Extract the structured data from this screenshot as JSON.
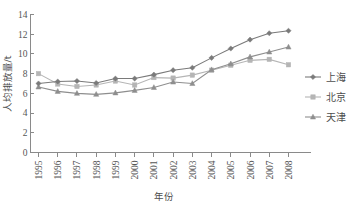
{
  "chart_data": {
    "type": "line",
    "title": "",
    "xlabel": "年份",
    "ylabel": "人均排放量/t",
    "x": [
      "1995",
      "1996",
      "1997",
      "1998",
      "1999",
      "2000",
      "2001",
      "2002",
      "2003",
      "2004",
      "2005",
      "2006",
      "2007",
      "2008"
    ],
    "categories": [
      "1995",
      "1996",
      "1997",
      "1998",
      "1999",
      "2000",
      "2001",
      "2002",
      "2003",
      "2004",
      "2005",
      "2006",
      "2007",
      "2008"
    ],
    "xlim": [
      1995,
      2008
    ],
    "ylim": [
      0,
      14
    ],
    "yticks": [
      0,
      2,
      4,
      6,
      8,
      10,
      12,
      14
    ],
    "ytick_labels": [
      "0",
      "2",
      "4",
      "6",
      "8",
      "10",
      "12",
      "14"
    ],
    "grid": false,
    "legend_position": "right",
    "series": [
      {
        "name": "上海",
        "marker": "diamond",
        "color": "#7a7a7a",
        "values": [
          7.0,
          7.2,
          7.25,
          7.05,
          7.5,
          7.5,
          7.9,
          8.35,
          8.6,
          9.6,
          10.55,
          11.45,
          12.1,
          12.35
        ]
      },
      {
        "name": "北京",
        "marker": "square",
        "color": "#b5b5b5",
        "values": [
          8.0,
          6.95,
          6.7,
          6.85,
          7.25,
          6.85,
          7.6,
          7.55,
          7.85,
          8.35,
          8.85,
          9.35,
          9.45,
          8.9
        ]
      },
      {
        "name": "天津",
        "marker": "triangle",
        "color": "#8e8e8e",
        "values": [
          6.65,
          6.2,
          6.0,
          5.9,
          6.05,
          6.3,
          6.6,
          7.15,
          7.0,
          8.4,
          9.0,
          9.7,
          10.2,
          10.7
        ]
      }
    ]
  },
  "legend": {
    "items": [
      {
        "label": "上海",
        "marker": "diamond",
        "color": "#7a7a7a"
      },
      {
        "label": "北京",
        "marker": "square",
        "color": "#b5b5b5"
      },
      {
        "label": "天津",
        "marker": "triangle",
        "color": "#8e8e8e"
      }
    ]
  },
  "axes": {
    "y_axis_title": "人均排放量/t",
    "x_axis_title": "年份"
  },
  "colors": {
    "axis": "#8a8a8a",
    "text": "#4d4d4d",
    "background": "#ffffff"
  }
}
